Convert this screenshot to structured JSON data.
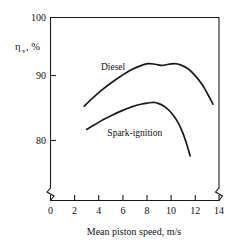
{
  "chart_data": {
    "type": "line",
    "title": "",
    "subtitle": "",
    "xlabel": "Mean piston speed, m/s",
    "ylabel": "ηv, %",
    "ylabel_symbol": "η",
    "ylabel_subscript": "v",
    "ylabel_units": ", %",
    "xlim": [
      0,
      14
    ],
    "ylim": [
      76,
      100
    ],
    "grid": false,
    "legend": "inline-curve-labels",
    "x_ticks": [
      0,
      2,
      4,
      6,
      8,
      10,
      12,
      14
    ],
    "x_tick_labels": [
      "0",
      "2",
      "4",
      "6",
      "8",
      "10",
      "12",
      "14"
    ],
    "y_ticks": [
      80,
      90,
      100
    ],
    "y_tick_labels": [
      "80",
      "90",
      "100"
    ],
    "axis_breaks": {
      "y_axis_below": 80,
      "x_axis_left_of": 0,
      "x_axis_right_of": 14,
      "note": "zigzag break marks on the vertical axis and at both ends of the horizontal axis"
    },
    "series": [
      {
        "name": "Diesel",
        "label": "Diesel",
        "label_x": 5.2,
        "label_y": 91.5,
        "x": [
          2.8,
          3.5,
          4.2,
          5.0,
          5.8,
          6.6,
          7.4,
          8.1,
          8.7,
          9.3,
          9.8,
          10.3,
          10.8,
          11.4,
          12.0,
          12.6,
          13.1,
          13.5
        ],
        "y": [
          85.6,
          86.9,
          88.1,
          89.3,
          90.4,
          91.4,
          92.1,
          92.5,
          92.4,
          92.2,
          92.4,
          92.5,
          92.3,
          91.7,
          90.6,
          89.1,
          87.4,
          85.9
        ]
      },
      {
        "name": "Spark-ignition",
        "label": "Spark-ignition",
        "label_x": 7.0,
        "label_y": 80.8,
        "x": [
          3.0,
          3.7,
          4.4,
          5.2,
          6.0,
          6.8,
          7.5,
          8.1,
          8.6,
          9.0,
          9.4,
          9.8,
          10.2,
          10.6,
          11.0,
          11.3,
          11.6
        ],
        "y": [
          81.8,
          82.6,
          83.4,
          84.2,
          84.9,
          85.5,
          85.9,
          86.1,
          86.2,
          86.0,
          85.6,
          85.0,
          84.1,
          82.9,
          81.2,
          79.5,
          77.5
        ]
      }
    ],
    "colors": {
      "curve": "#1a1a1a",
      "axis": "#1a1a1a",
      "background": "#ffffff",
      "text": "#111111"
    }
  }
}
